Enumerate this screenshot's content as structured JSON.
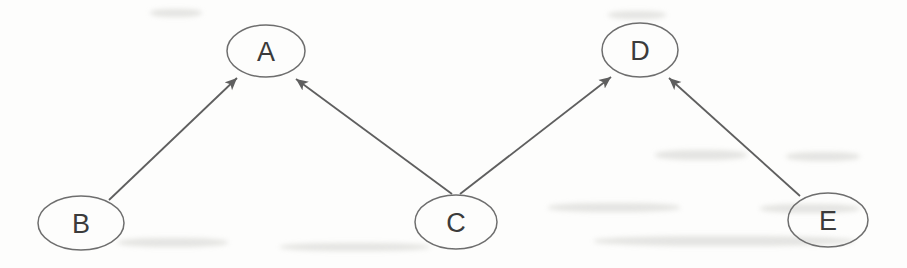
{
  "diagram": {
    "type": "directed-graph",
    "background": "#fdfdfc",
    "colors": {
      "edge_stroke": "#5f5f5f",
      "node_stroke": "#6e6e6e",
      "label": "#3b3b3b"
    },
    "nodes": [
      {
        "id": "A",
        "label": "A",
        "cx": 266,
        "cy": 51,
        "rx": 39,
        "ry": 26
      },
      {
        "id": "B",
        "label": "B",
        "cx": 81,
        "cy": 223,
        "rx": 43,
        "ry": 27
      },
      {
        "id": "C",
        "label": "C",
        "cx": 456,
        "cy": 222,
        "rx": 41,
        "ry": 27
      },
      {
        "id": "D",
        "label": "D",
        "cx": 640,
        "cy": 50,
        "rx": 38,
        "ry": 27
      },
      {
        "id": "E",
        "label": "E",
        "cx": 828,
        "cy": 220,
        "rx": 40,
        "ry": 27
      }
    ],
    "edges": [
      {
        "from": "B",
        "to": "A",
        "x1": 109,
        "y1": 200,
        "x2": 237,
        "y2": 78
      },
      {
        "from": "C",
        "to": "A",
        "x1": 452,
        "y1": 194,
        "x2": 296,
        "y2": 79
      },
      {
        "from": "C",
        "to": "D",
        "x1": 460,
        "y1": 194,
        "x2": 611,
        "y2": 77
      },
      {
        "from": "E",
        "to": "D",
        "x1": 800,
        "y1": 196,
        "x2": 669,
        "y2": 78
      }
    ],
    "arrow_style": "filled-triangle"
  }
}
